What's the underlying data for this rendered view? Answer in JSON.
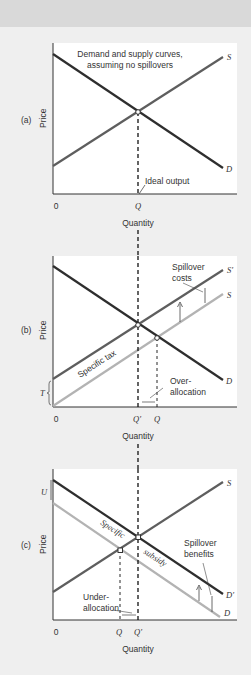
{
  "figure": {
    "panels": [
      {
        "id": "a",
        "tag": "(a)",
        "ylabel": "Price",
        "xlabel": "Quantity",
        "title_line1": "Demand and supply curves,",
        "title_line2": "assuming no spillovers",
        "x_ticks": [
          "0",
          "Q"
        ],
        "curves": [
          "S",
          "D"
        ],
        "annotation": "Ideal output"
      },
      {
        "id": "b",
        "tag": "(b)",
        "ylabel": "Price",
        "xlabel": "Quantity",
        "x_ticks": [
          "0",
          "Q'",
          "Q"
        ],
        "curves": [
          "S'",
          "S",
          "D"
        ],
        "y_marker": "T",
        "tax_label": "Specific tax",
        "spillover_line1": "Spillover",
        "spillover_line2": "costs",
        "alloc_line1": "Over-",
        "alloc_line2": "allocation"
      },
      {
        "id": "c",
        "tag": "(c)",
        "ylabel": "Price",
        "xlabel": "Quantity",
        "x_ticks": [
          "0",
          "Q",
          "Q'"
        ],
        "curves": [
          "S",
          "D'",
          "D"
        ],
        "y_marker": "U",
        "subsidy_label1": "Specific",
        "subsidy_label2": "subsidy",
        "spillover_line1": "Spillover",
        "spillover_line2": "benefits",
        "alloc_line1": "Under-",
        "alloc_line2": "allocation"
      }
    ],
    "colors": {
      "demand": "#2e2e2e",
      "supply": "#5e5e5e",
      "shifted_light": "#b3b3b3",
      "plot_bg": "#ffffff",
      "page_bg": "#efefef",
      "top_band": "#d9d9d9"
    }
  }
}
